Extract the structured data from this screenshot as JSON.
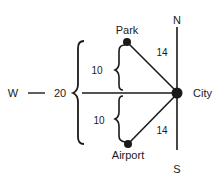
{
  "diagram": {
    "compass": {
      "north": "N",
      "south": "S",
      "west": "W"
    },
    "nodes": {
      "park": {
        "label": "Park"
      },
      "airport": {
        "label": "Airport"
      },
      "city": {
        "label": "City"
      }
    },
    "edges": {
      "park_city": {
        "distance": "14"
      },
      "airport_city": {
        "distance": "14"
      }
    },
    "dimensions": {
      "west_distance": "20",
      "upper_offset": "10",
      "lower_offset": "10"
    },
    "colors": {
      "ink": "#1a1a1a",
      "background": "#ffffff"
    }
  }
}
